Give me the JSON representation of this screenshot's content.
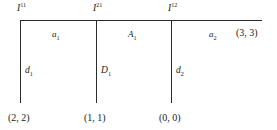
{
  "diagram": {
    "stroke_color": "#2b2b2b",
    "background_color": "#ffffff",
    "nodes": [
      {
        "id": "node-1",
        "base": "I",
        "sup": "11",
        "text": "I11",
        "x": 20
      },
      {
        "id": "node-2",
        "base": "I",
        "sup": "21",
        "text": "I21",
        "x": 96
      },
      {
        "id": "node-3",
        "base": "I",
        "sup": "12",
        "text": "I12",
        "x": 171
      }
    ],
    "segments": [
      {
        "id": "segment-a1",
        "base": "a",
        "sub": "1",
        "text": "a1"
      },
      {
        "id": "segment-A1",
        "base": "A",
        "sub": "1",
        "text": "A1"
      },
      {
        "id": "segment-a2",
        "base": "a",
        "sub": "2",
        "text": "a2"
      }
    ],
    "branches": [
      {
        "id": "branch-d1",
        "base": "d",
        "sub": "1",
        "text": "d1"
      },
      {
        "id": "branch-D1",
        "base": "D",
        "sub": "1",
        "text": "D1"
      },
      {
        "id": "branch-d2",
        "base": "d",
        "sub": "2",
        "text": "d2"
      }
    ],
    "coordinates": {
      "right_end": "(3, 3)",
      "leaf_1": "(2, 2)",
      "leaf_2": "(1, 1)",
      "leaf_3": "(0, 0)"
    }
  }
}
